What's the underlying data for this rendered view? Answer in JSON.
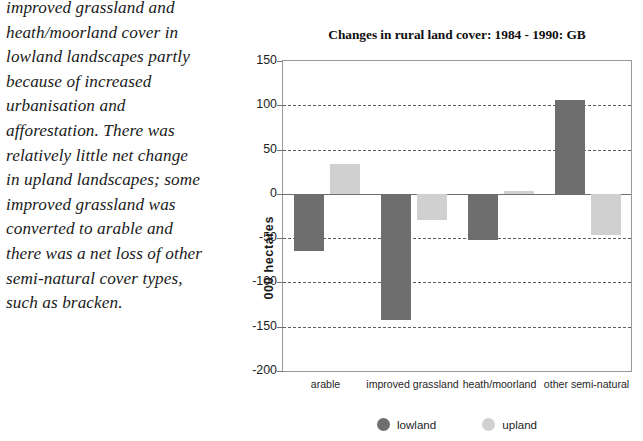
{
  "prose": {
    "lines": [
      "of grassland cover,",
      "improved grassland and",
      "heath/moorland cover in",
      "lowland landscapes partly",
      "because of increased",
      "urbanisation and",
      "afforestation. There was",
      "relatively little net change",
      "in upland landscapes; some",
      "improved grassland was",
      "converted to arable and",
      "there was a net loss of other",
      "semi-natural cover types,",
      "such as bracken."
    ]
  },
  "chart_data": {
    "type": "bar",
    "title": "Changes in rural land cover: 1984 - 1990: GB",
    "xlabel": "",
    "ylabel": "000  hectares",
    "categories": [
      "arable",
      "improved grassland",
      "heath/moorland",
      "other semi-natural"
    ],
    "series": [
      {
        "name": "lowland",
        "color": "#6e6e6e",
        "values": [
          -65,
          -142,
          -52,
          106
        ]
      },
      {
        "name": "upland",
        "color": "#d0d0d0",
        "values": [
          34,
          -29,
          3,
          -46
        ]
      }
    ],
    "ylim": [
      -200,
      150
    ],
    "ytick_step": 50,
    "yticks": [
      150,
      100,
      50,
      0,
      -50,
      -100,
      -150,
      -200
    ],
    "ytick_labels": [
      "150",
      "100",
      "50",
      "0",
      "-50",
      "-100",
      "-150",
      "-200"
    ],
    "grid": true,
    "grid_style": "dashed",
    "legend_position": "bottom-center"
  }
}
